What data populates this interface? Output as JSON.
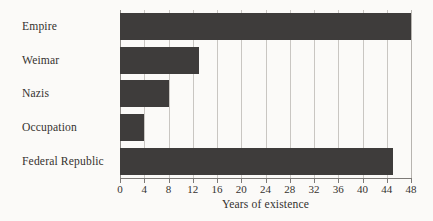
{
  "chart_data": {
    "type": "bar",
    "orientation": "horizontal",
    "title": "",
    "subtitle": "",
    "categories": [
      "Empire",
      "Weimar",
      "Nazis",
      "Occupation",
      "Federal Republic"
    ],
    "values": [
      48,
      13,
      8,
      4,
      45
    ],
    "xlabel": "Years of existence",
    "ylabel": "",
    "xlim": [
      0,
      48
    ],
    "xticks": [
      0,
      4,
      8,
      12,
      16,
      20,
      24,
      28,
      32,
      36,
      40,
      44,
      48
    ],
    "xtick_labels": [
      "0",
      "4",
      "8",
      "12",
      "16",
      "20",
      "24",
      "28",
      "32",
      "36",
      "40",
      "44",
      "48"
    ],
    "grid": "vertical",
    "legend": null,
    "bar_color": "#3e3c3b",
    "gridline_color": "#c9c6c2",
    "axis_color": "#7d7a77",
    "background_color": "#fbfaf8"
  }
}
